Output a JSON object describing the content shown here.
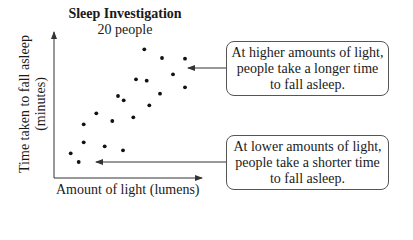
{
  "chart_data": {
    "type": "scatter",
    "title": "Sleep Investigation",
    "subtitle": "20 people",
    "xlabel": "Amount of light (lumens)",
    "ylabel_lines": [
      "Time taken to fall asleep",
      "(minutes)"
    ],
    "grid": false,
    "legend": null,
    "axis_ticks": false,
    "points_px": [
      [
        144.3,
        49.3
      ],
      [
        162,
        58
      ],
      [
        185,
        58.7
      ],
      [
        173,
        74.3
      ],
      [
        136,
        79.3
      ],
      [
        146.7,
        80.7
      ],
      [
        185,
        87.3
      ],
      [
        160,
        93.7
      ],
      [
        118,
        96
      ],
      [
        123.7,
        100.3
      ],
      [
        149.3,
        105.3
      ],
      [
        96.3,
        113.3
      ],
      [
        133.3,
        117.3
      ],
      [
        112.3,
        121
      ],
      [
        83.7,
        124.3
      ],
      [
        83.7,
        142.3
      ],
      [
        104.7,
        146.3
      ],
      [
        123,
        150.3
      ],
      [
        70.7,
        153.3
      ],
      [
        78.7,
        162
      ]
    ],
    "n_points": 20,
    "trend": "positive",
    "annotations": [
      {
        "id": "high",
        "lines": [
          "At higher amounts of light,",
          "people take a longer time",
          "to fall asleep."
        ],
        "points_to": "upper-right cluster"
      },
      {
        "id": "low",
        "lines": [
          "At lower amounts of light,",
          "people take a shorter time",
          "to fall asleep."
        ],
        "points_to": "lower-left cluster"
      }
    ]
  },
  "header": {
    "title": "Sleep Investigation",
    "subtitle": "20 people"
  },
  "axes": {
    "x_label": "Amount of light (lumens)",
    "y_label_line1": "Time taken to fall asleep",
    "y_label_line2": "(minutes)"
  },
  "callouts": {
    "high": {
      "line1": "At higher amounts of light,",
      "line2": "people take a longer time",
      "line3": "to fall asleep."
    },
    "low": {
      "line1": "At lower amounts of light,",
      "line2": "people take a shorter time",
      "line3": "to fall asleep."
    }
  }
}
